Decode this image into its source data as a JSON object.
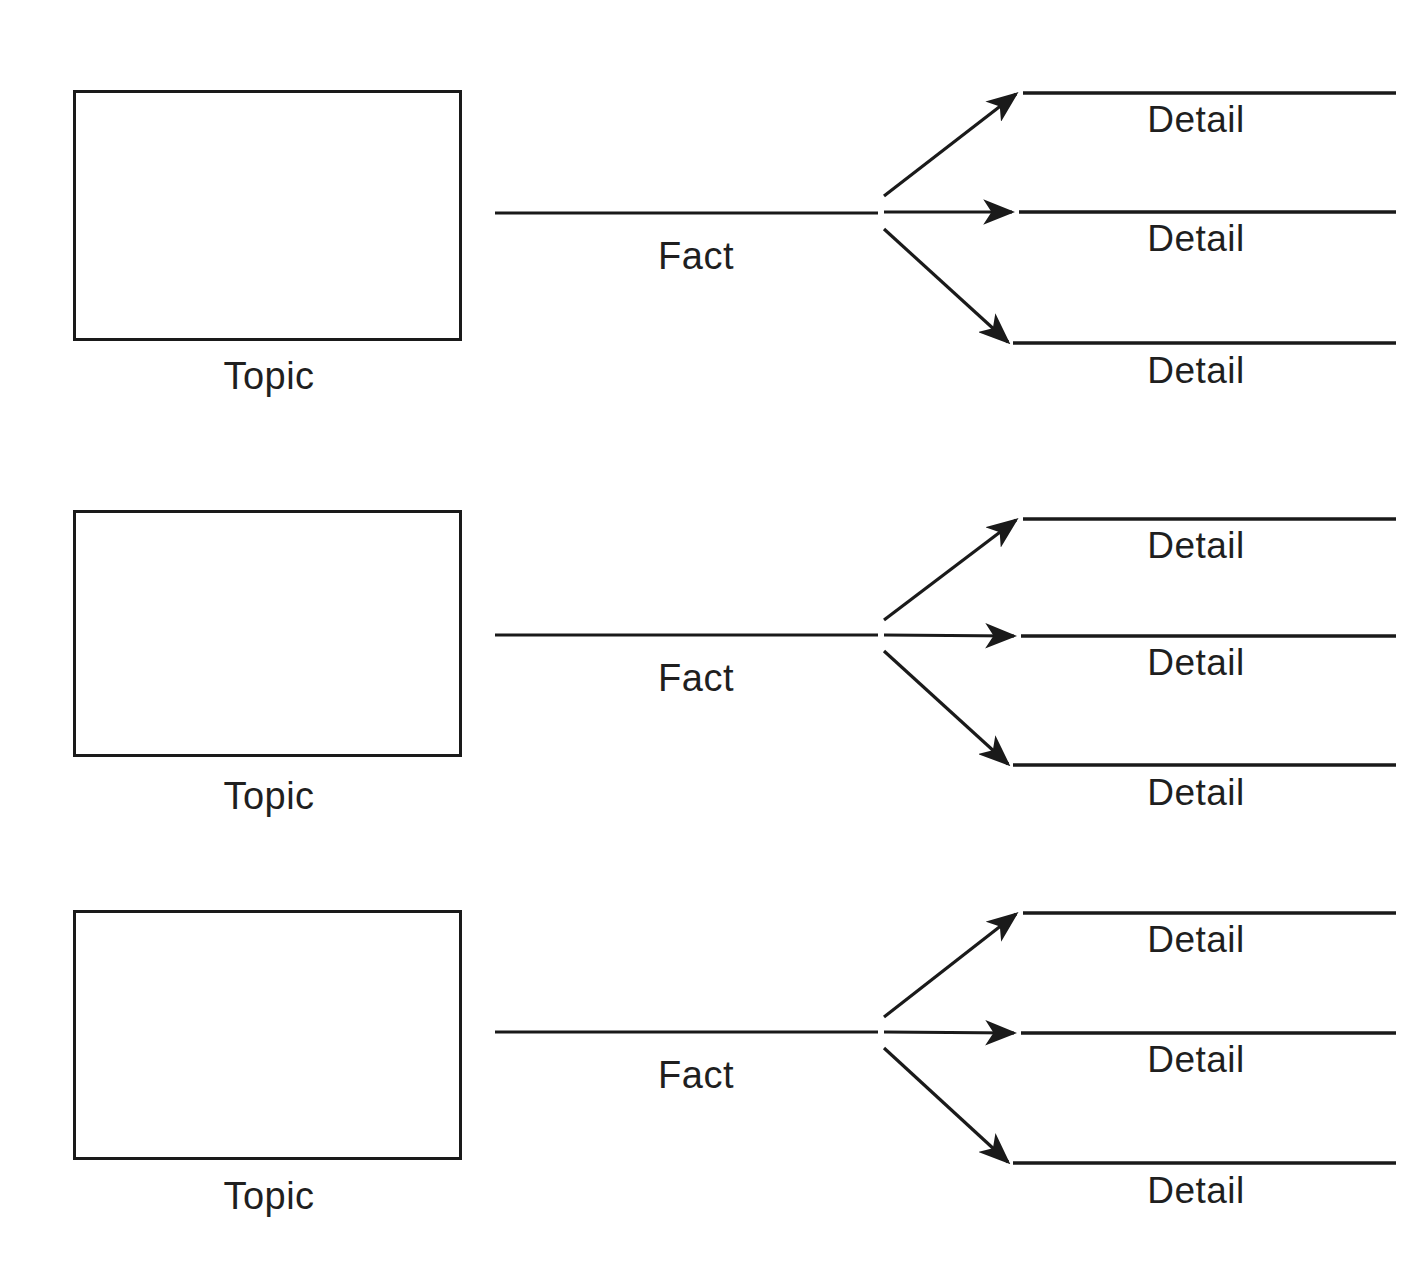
{
  "document": {
    "title": "Topic - Fact - Detail Graphic Organizer",
    "page_width": 1403,
    "page_height": 1276,
    "background_color": "#ffffff",
    "ink_color": "#1a1a1a"
  },
  "labels": {
    "topic": "Topic",
    "fact": "Fact",
    "detail": "Detail"
  },
  "groups": [
    {
      "id": "group-1",
      "topic": {
        "label": "Topic",
        "box": {
          "x": 73,
          "y": 90,
          "width": 389,
          "height": 251
        },
        "label_center_x": 269,
        "label_y": 357
      },
      "fact": {
        "label": "Fact",
        "line": {
          "x1": 495,
          "y1": 213,
          "x2": 878,
          "y2": 213
        },
        "label_center_x": 696,
        "label_y": 237
      },
      "branch_origin": {
        "x": 878,
        "y": 213
      },
      "details": [
        {
          "label": "Detail",
          "arrow": {
            "x1": 884,
            "y1": 196,
            "x2": 1016,
            "y2": 94
          },
          "line": {
            "x1": 1023,
            "y1": 93,
            "x2": 1396,
            "y2": 93
          },
          "label_center_x": 1196,
          "label_y": 101
        },
        {
          "label": "Detail",
          "arrow": {
            "x1": 884,
            "y1": 212,
            "x2": 1012,
            "y2": 212
          },
          "line": {
            "x1": 1019,
            "y1": 212,
            "x2": 1396,
            "y2": 212
          },
          "label_center_x": 1196,
          "label_y": 220
        },
        {
          "label": "Detail",
          "arrow": {
            "x1": 884,
            "y1": 229,
            "x2": 1008,
            "y2": 342
          },
          "line": {
            "x1": 1013,
            "y1": 343,
            "x2": 1396,
            "y2": 343
          },
          "label_center_x": 1196,
          "label_y": 352
        }
      ]
    },
    {
      "id": "group-2",
      "topic": {
        "label": "Topic",
        "box": {
          "x": 73,
          "y": 510,
          "width": 389,
          "height": 247
        },
        "label_center_x": 269,
        "label_y": 777
      },
      "fact": {
        "label": "Fact",
        "line": {
          "x1": 495,
          "y1": 635,
          "x2": 878,
          "y2": 635
        },
        "label_center_x": 696,
        "label_y": 659
      },
      "branch_origin": {
        "x": 878,
        "y": 635
      },
      "details": [
        {
          "label": "Detail",
          "arrow": {
            "x1": 884,
            "y1": 620,
            "x2": 1016,
            "y2": 520
          },
          "line": {
            "x1": 1023,
            "y1": 519,
            "x2": 1396,
            "y2": 519
          },
          "label_center_x": 1196,
          "label_y": 527
        },
        {
          "label": "Detail",
          "arrow": {
            "x1": 884,
            "y1": 635,
            "x2": 1014,
            "y2": 636
          },
          "line": {
            "x1": 1021,
            "y1": 636,
            "x2": 1396,
            "y2": 636
          },
          "label_center_x": 1196,
          "label_y": 644
        },
        {
          "label": "Detail",
          "arrow": {
            "x1": 884,
            "y1": 651,
            "x2": 1008,
            "y2": 764
          },
          "line": {
            "x1": 1013,
            "y1": 765,
            "x2": 1396,
            "y2": 765
          },
          "label_center_x": 1196,
          "label_y": 774
        }
      ]
    },
    {
      "id": "group-3",
      "topic": {
        "label": "Topic",
        "box": {
          "x": 73,
          "y": 910,
          "width": 389,
          "height": 250
        },
        "label_center_x": 269,
        "label_y": 1177
      },
      "fact": {
        "label": "Fact",
        "line": {
          "x1": 495,
          "y1": 1032,
          "x2": 878,
          "y2": 1032
        },
        "label_center_x": 696,
        "label_y": 1056
      },
      "branch_origin": {
        "x": 878,
        "y": 1032
      },
      "details": [
        {
          "label": "Detail",
          "arrow": {
            "x1": 884,
            "y1": 1017,
            "x2": 1016,
            "y2": 914
          },
          "line": {
            "x1": 1023,
            "y1": 913,
            "x2": 1396,
            "y2": 913
          },
          "label_center_x": 1196,
          "label_y": 921
        },
        {
          "label": "Detail",
          "arrow": {
            "x1": 884,
            "y1": 1032,
            "x2": 1014,
            "y2": 1033
          },
          "line": {
            "x1": 1021,
            "y1": 1033,
            "x2": 1396,
            "y2": 1033
          },
          "label_center_x": 1196,
          "label_y": 1041
        },
        {
          "label": "Detail",
          "arrow": {
            "x1": 884,
            "y1": 1048,
            "x2": 1008,
            "y2": 1162
          },
          "line": {
            "x1": 1013,
            "y1": 1163,
            "x2": 1396,
            "y2": 1163
          },
          "label_center_x": 1196,
          "label_y": 1172
        }
      ]
    }
  ]
}
